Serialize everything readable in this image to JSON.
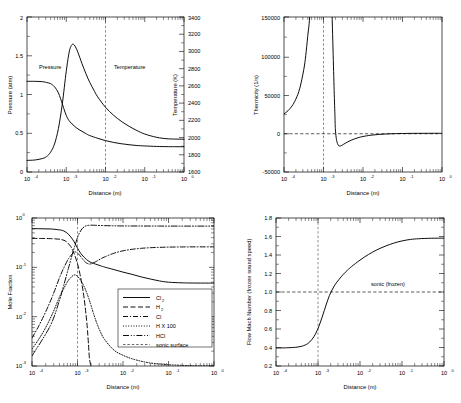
{
  "figure": {
    "name": "detonation-zdnd-structure-four-panel",
    "width": 461,
    "height": 403,
    "background": "#ffffff",
    "line_color": "#000000",
    "sonic_color": "#666666"
  },
  "common": {
    "xlabel": "Distance (m)",
    "xticks": [
      "10",
      "10",
      "10",
      "10",
      "10"
    ],
    "xtick_exponents": [
      "-4",
      "-3",
      "-2",
      "-1",
      "0"
    ],
    "xlim_log10": [
      -4,
      0
    ],
    "sonic_surface_x": 0.002
  },
  "chart_data": [
    {
      "id": "panel-pressure-temperature",
      "position": "top-left",
      "type": "line",
      "title": "",
      "xlabel": "Distance (m)",
      "xscale": "log",
      "xlim": [
        0.0001,
        1.0
      ],
      "ylabel": "Pressure (atm)",
      "ylim": [
        0,
        2
      ],
      "yticks": [
        "0",
        "0.5",
        "1",
        "1.5",
        "2"
      ],
      "ytickvals": [
        0,
        0.5,
        1,
        1.5,
        2
      ],
      "y2label": "Temperature (K)",
      "y2lim": [
        1600,
        3400
      ],
      "y2ticks": [
        "1600",
        "1800",
        "2000",
        "2200",
        "2400",
        "2600",
        "2800",
        "3000",
        "3200",
        "3400"
      ],
      "y2tickvals": [
        1600,
        1800,
        2000,
        2200,
        2400,
        2600,
        2800,
        3000,
        3200,
        3400
      ],
      "grid": false,
      "legend": "inline-labels",
      "annotations": [
        {
          "text": "Pressure",
          "x_log10": -3.62,
          "y_value": 1.22
        },
        {
          "text": "Temperature",
          "x_log10": -2.28,
          "y_value": 1.22
        }
      ],
      "series": [
        {
          "name": "Pressure",
          "axis": "left",
          "style": "solid",
          "x_log10": [
            -4.0,
            -3.8,
            -3.6,
            -3.5,
            -3.4,
            -3.3,
            -3.2,
            -3.1,
            -3.05,
            -3.0,
            -2.95,
            -2.9,
            -2.8,
            -2.7,
            -2.6,
            -2.5,
            -2.4,
            -2.2,
            -2.0,
            -1.8,
            -1.6,
            -1.4,
            -1.2,
            -1.0,
            -0.7,
            -0.4,
            0.0
          ],
          "values": [
            1.17,
            1.17,
            1.165,
            1.155,
            1.14,
            1.1,
            1.02,
            0.88,
            0.8,
            0.73,
            0.68,
            0.645,
            0.595,
            0.555,
            0.525,
            0.495,
            0.47,
            0.435,
            0.405,
            0.382,
            0.365,
            0.352,
            0.342,
            0.336,
            0.33,
            0.327,
            0.326
          ]
        },
        {
          "name": "Temperature",
          "axis": "right",
          "style": "solid",
          "x_log10": [
            -4.0,
            -3.8,
            -3.6,
            -3.5,
            -3.4,
            -3.3,
            -3.2,
            -3.1,
            -3.0,
            -2.92,
            -2.85,
            -2.8,
            -2.75,
            -2.7,
            -2.6,
            -2.5,
            -2.4,
            -2.3,
            -2.2,
            -2.0,
            -1.8,
            -1.6,
            -1.4,
            -1.2,
            -1.0,
            -0.7,
            -0.4,
            0.0
          ],
          "values_left_axis_equivalent": [
            0.15,
            0.155,
            0.175,
            0.2,
            0.255,
            0.36,
            0.56,
            0.88,
            1.3,
            1.56,
            1.645,
            1.64,
            1.6,
            1.54,
            1.4,
            1.27,
            1.155,
            1.06,
            0.97,
            0.835,
            0.735,
            0.655,
            0.59,
            0.535,
            0.49,
            0.448,
            0.428,
            0.423
          ],
          "values_kelvin": [
            1735,
            1740,
            1758,
            1780,
            1830,
            1924,
            2104,
            2392,
            2770,
            3004,
            3081,
            3076,
            3040,
            2986,
            2860,
            2743,
            2640,
            2554,
            2473,
            2352,
            2262,
            2190,
            2131,
            2082,
            2041,
            2003,
            1985,
            1981
          ]
        }
      ]
    },
    {
      "id": "panel-thermicity",
      "position": "top-right",
      "type": "line",
      "xlabel": "Distance (m)",
      "xscale": "log",
      "xlim": [
        0.0001,
        1.0
      ],
      "ylabel": "Thermicity (1/s)",
      "ylim": [
        -50000,
        150000
      ],
      "yticks": [
        "-50000",
        "0",
        "50000",
        "100000",
        "150000"
      ],
      "ytickvals": [
        -50000,
        0,
        50000,
        100000,
        150000
      ],
      "grid": false,
      "zero_line": 0,
      "series": [
        {
          "name": "Thermicity",
          "style": "solid",
          "x_log10": [
            -4.0,
            -3.9,
            -3.8,
            -3.7,
            -3.6,
            -3.5,
            -3.45,
            -3.4,
            -3.35,
            -3.3,
            -3.27,
            -3.24,
            -3.2,
            -3.0,
            -2.88,
            -2.84,
            -2.8,
            -2.76,
            -2.73,
            -2.71,
            -2.7,
            -2.68,
            -2.66,
            -2.63,
            -2.6,
            -2.55,
            -2.5,
            -2.4,
            -2.3,
            -2.2,
            -2.1,
            -2.0,
            -1.8,
            -1.6,
            -1.4,
            -1.2,
            -1.0,
            -0.6,
            0.0
          ],
          "values": [
            25000,
            29000,
            35000,
            44000,
            58000,
            82000,
            100000,
            125000,
            150000,
            200000,
            260000,
            340000,
            460000,
            900000,
            430000,
            300000,
            190000,
            110000,
            55000,
            22000,
            6000,
            -5000,
            -11000,
            -15000,
            -16500,
            -16000,
            -14500,
            -11500,
            -9000,
            -7000,
            -5400,
            -4200,
            -2500,
            -1500,
            -900,
            -520,
            -300,
            -110,
            -30
          ]
        }
      ]
    },
    {
      "id": "panel-mole-fraction",
      "position": "bottom-left",
      "type": "line",
      "xlabel": "Distance (m)",
      "xscale": "log",
      "xlim": [
        0.0001,
        1.0
      ],
      "ylabel": "Mole Fraction",
      "yscale": "log",
      "ylim": [
        0.001,
        1.0
      ],
      "yticks": [
        "10",
        "10",
        "10",
        "10"
      ],
      "ytick_exponents": [
        "-3",
        "-2",
        "-1",
        "0"
      ],
      "ytickvals": [
        0.001,
        0.01,
        0.1,
        1.0
      ],
      "grid": false,
      "legend_position": "lower-right-inside",
      "legend": [
        {
          "label": "Cl",
          "subscript": "2",
          "style": "solid"
        },
        {
          "label": "H",
          "subscript": "2",
          "style": "dashed"
        },
        {
          "label": "Cl",
          "subscript": "",
          "style": "dashdot"
        },
        {
          "label": "H X 100",
          "subscript": "",
          "style": "dotted"
        },
        {
          "label": "HCl",
          "subscript": "",
          "style": "dashdotdot"
        },
        {
          "label": "sonic surface",
          "subscript": "",
          "style": "thin-dashed"
        }
      ],
      "series": [
        {
          "name": "Cl2",
          "style": "solid",
          "x_log10": [
            -4.0,
            -3.8,
            -3.6,
            -3.4,
            -3.3,
            -3.2,
            -3.1,
            -3.05,
            -3.0,
            -2.95,
            -2.9,
            -2.8,
            -2.7,
            -2.6,
            -2.5,
            -2.4,
            -2.2,
            -2.0,
            -1.8,
            -1.6,
            -1.4,
            -1.2,
            -1.0,
            -0.7,
            -0.4,
            0.0
          ],
          "values": [
            0.61,
            0.605,
            0.6,
            0.575,
            0.545,
            0.47,
            0.36,
            0.3,
            0.245,
            0.205,
            0.178,
            0.143,
            0.125,
            0.116,
            0.108,
            0.101,
            0.09,
            0.08,
            0.072,
            0.064,
            0.058,
            0.053,
            0.05,
            0.0485,
            0.048,
            0.048
          ]
        },
        {
          "name": "H2",
          "style": "dashed",
          "x_log10": [
            -4.0,
            -3.8,
            -3.6,
            -3.45,
            -3.35,
            -3.25,
            -3.15,
            -3.1,
            -3.05,
            -3.0,
            -2.95,
            -2.9,
            -2.85,
            -2.8,
            -2.78,
            -2.76,
            -2.74,
            -2.72,
            -2.71,
            -2.705
          ],
          "values": [
            0.385,
            0.385,
            0.382,
            0.375,
            0.365,
            0.335,
            0.265,
            0.215,
            0.165,
            0.118,
            0.076,
            0.044,
            0.022,
            0.0085,
            0.0052,
            0.0029,
            0.0015,
            0.00115,
            0.00102,
            0.001
          ]
        },
        {
          "name": "Cl",
          "style": "dashdot",
          "x_log10": [
            -4.0,
            -3.85,
            -3.7,
            -3.55,
            -3.4,
            -3.3,
            -3.2,
            -3.1,
            -3.05,
            -3.0,
            -2.95,
            -2.9,
            -2.85,
            -2.8,
            -2.75,
            -2.7,
            -2.6,
            -2.5,
            -2.4,
            -2.2,
            -2.0,
            -1.8,
            -1.6,
            -1.4,
            -1.2,
            -1.0,
            -0.7,
            -0.4,
            0.0
          ],
          "values": [
            0.0037,
            0.0065,
            0.0125,
            0.026,
            0.06,
            0.098,
            0.148,
            0.195,
            0.205,
            0.196,
            0.175,
            0.152,
            0.134,
            0.122,
            0.117,
            0.118,
            0.13,
            0.147,
            0.163,
            0.193,
            0.216,
            0.232,
            0.243,
            0.25,
            0.254,
            0.257,
            0.259,
            0.26,
            0.26
          ]
        },
        {
          "name": "H X 100",
          "style": "dotted",
          "x_log10": [
            -4.0,
            -3.85,
            -3.7,
            -3.55,
            -3.4,
            -3.3,
            -3.2,
            -3.1,
            -3.05,
            -3.0,
            -2.95,
            -2.9,
            -2.85,
            -2.8,
            -2.75,
            -2.7,
            -2.6,
            -2.5,
            -2.4,
            -2.2,
            -2.0,
            -1.8,
            -1.6,
            -1.4,
            -1.2,
            -1.0,
            -0.7,
            -0.4,
            0.0
          ],
          "values": [
            0.0022,
            0.0035,
            0.006,
            0.0115,
            0.0245,
            0.0375,
            0.0545,
            0.068,
            0.07,
            0.066,
            0.058,
            0.049,
            0.04,
            0.031,
            0.023,
            0.0165,
            0.0085,
            0.005,
            0.0034,
            0.0021,
            0.00165,
            0.0014,
            0.00125,
            0.00115,
            0.0011,
            0.00106,
            0.00103,
            0.00101,
            0.001
          ]
        },
        {
          "name": "HCl",
          "style": "dashdotdot",
          "x_log10": [
            -4.0,
            -3.6,
            -3.4,
            -3.3,
            -3.2,
            -3.1,
            -3.0,
            -2.95,
            -2.9,
            -2.85,
            -2.8,
            -2.7,
            -2.6,
            -2.4,
            -2.2,
            -2.0,
            -1.6,
            -1.2,
            -0.8,
            -0.4,
            0.0
          ],
          "values": [
            0.0016,
            0.0065,
            0.021,
            0.044,
            0.095,
            0.205,
            0.4,
            0.51,
            0.605,
            0.665,
            0.7,
            0.715,
            0.71,
            0.7,
            0.695,
            0.69,
            0.688,
            0.686,
            0.685,
            0.685,
            0.685
          ]
        }
      ]
    },
    {
      "id": "panel-mach-number",
      "position": "bottom-right",
      "type": "line",
      "xlabel": "Distance (m)",
      "xscale": "log",
      "xlim": [
        0.0001,
        1.0
      ],
      "ylabel": "Flow Mach Number (frozen sound speed)",
      "ylim": [
        0.2,
        1.8
      ],
      "yticks": [
        "0.2",
        "0.4",
        "0.6",
        "0.8",
        "1.0",
        "1.2",
        "1.4",
        "1.6",
        "1.8"
      ],
      "ytickvals": [
        0.2,
        0.4,
        0.6,
        0.8,
        1.0,
        1.2,
        1.4,
        1.6,
        1.8
      ],
      "grid": false,
      "annotations": [
        {
          "text": "sonic (frozen)",
          "x_log10": -0.85,
          "y_value": 1.055
        }
      ],
      "reference_line": {
        "value": 1.0,
        "label": "sonic (frozen)",
        "style": "dashdot"
      },
      "series": [
        {
          "name": "Flow Mach Number",
          "style": "solid",
          "x_log10": [
            -4.0,
            -3.8,
            -3.6,
            -3.5,
            -3.4,
            -3.3,
            -3.2,
            -3.1,
            -3.05,
            -3.0,
            -2.95,
            -2.9,
            -2.85,
            -2.8,
            -2.75,
            -2.7,
            -2.6,
            -2.5,
            -2.4,
            -2.3,
            -2.2,
            -2.0,
            -1.8,
            -1.6,
            -1.4,
            -1.2,
            -1.0,
            -0.8,
            -0.6,
            -0.3,
            0.0
          ],
          "values": [
            0.395,
            0.396,
            0.4,
            0.404,
            0.412,
            0.428,
            0.458,
            0.515,
            0.556,
            0.605,
            0.665,
            0.73,
            0.8,
            0.87,
            0.935,
            0.99,
            1.075,
            1.135,
            1.19,
            1.235,
            1.275,
            1.345,
            1.405,
            1.455,
            1.495,
            1.528,
            1.552,
            1.568,
            1.576,
            1.581,
            1.582
          ]
        }
      ]
    }
  ]
}
